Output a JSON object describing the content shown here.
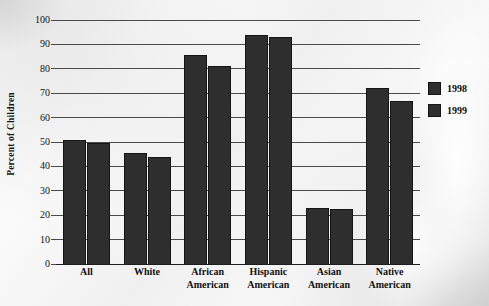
{
  "chart_data": {
    "type": "bar",
    "title": "",
    "xlabel": "",
    "ylabel": "Percent of Children",
    "ylim": [
      0,
      100
    ],
    "ytick_step": 10,
    "yticks": [
      0,
      10,
      20,
      30,
      40,
      50,
      60,
      70,
      80,
      90,
      100
    ],
    "grid": true,
    "legend_position": "right",
    "bar_color": "#2e2e2e",
    "categories": [
      "All",
      "White",
      "African American",
      "Hispanic American",
      "Asian American",
      "Native American"
    ],
    "category_lines": [
      [
        "All"
      ],
      [
        "White"
      ],
      [
        "African",
        "American"
      ],
      [
        "Hispanic",
        "American"
      ],
      [
        "Asian",
        "American"
      ],
      [
        "Native",
        "American"
      ]
    ],
    "series": [
      {
        "name": "1998",
        "values": [
          51,
          45.5,
          85.5,
          94,
          23,
          72
        ]
      },
      {
        "name": "1999",
        "values": [
          49.5,
          44,
          81,
          93,
          22.5,
          67
        ]
      }
    ]
  },
  "legend": {
    "items": [
      {
        "label": "1998"
      },
      {
        "label": "1999"
      }
    ]
  }
}
